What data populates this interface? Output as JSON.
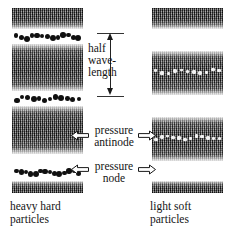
{
  "figure": {
    "background": "#ffffff",
    "dark_particle_color": "#101010",
    "light_particle_color": "#f2f2f2",
    "band_color": "#3d3d3d"
  },
  "center": {
    "half_wavelength": {
      "line1": "half",
      "line2": "wave-",
      "line3": "length"
    },
    "antinode": {
      "line1": "pressure",
      "line2": "antinode"
    },
    "node": {
      "line1": "pressure",
      "line2": "node"
    },
    "arrow_left_icon": "arrow-left-hollow-icon",
    "arrow_right_icon": "arrow-right-hollow-icon",
    "dimension_icon": "double-arrow-vertical-icon"
  },
  "left_column": {
    "caption_line1": "heavy hard",
    "caption_line2": "particles",
    "bands": [
      {
        "top": 8,
        "height": 21,
        "style": "solidtop"
      },
      {
        "top": 44,
        "height": 47,
        "style": "plain"
      },
      {
        "top": 106,
        "height": 48,
        "style": "plain"
      },
      {
        "top": 181,
        "height": 12,
        "style": "solidbot"
      }
    ],
    "chains": [
      {
        "top": 30,
        "kind": "dark",
        "count": 13
      },
      {
        "top": 92,
        "kind": "dark",
        "count": 12
      },
      {
        "top": 166,
        "kind": "dark",
        "count": 14
      }
    ]
  },
  "right_column": {
    "caption_line1": "light soft",
    "caption_line2": "particles",
    "bands": [
      {
        "top": 8,
        "height": 21,
        "style": "solidtop"
      },
      {
        "top": 51,
        "height": 44,
        "style": "plain"
      },
      {
        "top": 117,
        "height": 44,
        "style": "plain"
      },
      {
        "top": 181,
        "height": 12,
        "style": "solidbot"
      }
    ],
    "chains": [
      {
        "top": 66,
        "kind": "light",
        "count": 11
      },
      {
        "top": 132,
        "kind": "light",
        "count": 12
      }
    ]
  }
}
